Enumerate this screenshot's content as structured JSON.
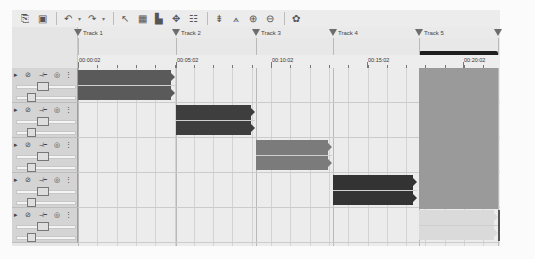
{
  "toolbar": {
    "buttons": [
      {
        "name": "copy-icon",
        "glyph": "⎘"
      },
      {
        "name": "paste-icon",
        "glyph": "▣"
      },
      {
        "name": "undo-icon",
        "glyph": "↶",
        "dropdown": "▾"
      },
      {
        "name": "redo-icon",
        "glyph": "↷",
        "dropdown": "▾"
      },
      {
        "name": "select-tool-icon",
        "glyph": "↖"
      },
      {
        "name": "split-tool-icon",
        "glyph": "▦"
      },
      {
        "name": "group-tool-icon",
        "glyph": "▙"
      },
      {
        "name": "envelope-tool-icon",
        "glyph": "✥"
      },
      {
        "name": "mixer-tool-icon",
        "glyph": "☷"
      },
      {
        "name": "snap-icon",
        "glyph": "⇟"
      },
      {
        "name": "pencil-envelope-icon",
        "glyph": "⟑"
      },
      {
        "name": "zoom-in-icon",
        "glyph": "⊕"
      },
      {
        "name": "zoom-out-icon",
        "glyph": "⊖"
      },
      {
        "name": "auto-ripple-icon",
        "glyph": "✿"
      }
    ]
  },
  "markers": [
    {
      "label": "Track 1",
      "x": 0
    },
    {
      "label": "Track 2",
      "x": 98
    },
    {
      "label": "Track 3",
      "x": 178
    },
    {
      "label": "Track 4",
      "x": 255
    },
    {
      "label": "Track 5",
      "x": 341
    },
    {
      "label": "",
      "x": 420
    }
  ],
  "ruler": {
    "labels": [
      {
        "text": "00:00:02",
        "x": 1
      },
      {
        "text": "00:05:02",
        "x": 99
      },
      {
        "text": "00:10:02",
        "x": 194
      },
      {
        "text": "00:15:02",
        "x": 290
      },
      {
        "text": "00:20:02",
        "x": 386
      }
    ]
  },
  "loop_region": {
    "start": 341,
    "end": 420
  },
  "tracks": [
    {
      "name": "track-1",
      "clip": {
        "x": 0,
        "w": 97,
        "color": "#5a5a5a",
        "label": ""
      }
    },
    {
      "name": "track-2",
      "clip": {
        "x": 98,
        "w": 79,
        "color": "#3e3e3e",
        "label": ""
      }
    },
    {
      "name": "track-3",
      "clip": {
        "x": 178,
        "w": 76,
        "color": "#7b7b7b",
        "label": ""
      }
    },
    {
      "name": "track-4",
      "clip": {
        "x": 255,
        "w": 84,
        "color": "#333333",
        "label": ""
      }
    },
    {
      "name": "track-5",
      "clip": {
        "x": 341,
        "w": 79,
        "color": "#dadada",
        "label": ""
      }
    }
  ],
  "selection": {
    "x": 341,
    "w": 79,
    "color": "#9a9a9a"
  },
  "track_header": {
    "icons": [
      {
        "name": "expand-icon",
        "glyph": "▸"
      },
      {
        "name": "mute-icon",
        "glyph": "⊘"
      },
      {
        "name": "route-icon",
        "glyph": "⊣⊢"
      },
      {
        "name": "solo-icon",
        "glyph": "◎"
      },
      {
        "name": "menu-icon",
        "glyph": "⋮"
      }
    ]
  }
}
